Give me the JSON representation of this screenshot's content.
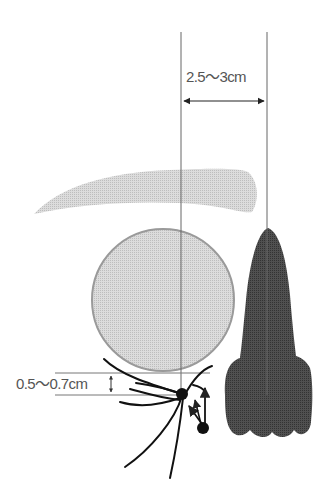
{
  "diagram": {
    "labels": {
      "width_measure": "2.5〜3cm",
      "height_measure": "0.5〜0.7cm"
    },
    "parts": [
      "eyebrow",
      "eye",
      "nose",
      "eyelashes",
      "measurement-lines"
    ],
    "colors": {
      "eyebrow": "#c9c9c9",
      "eye_fill": "#d6d6d6",
      "eye_stroke": "#9a9a9a",
      "nose": "#4a4a4a",
      "lines": "#666666",
      "lashes": "#111111",
      "text": "#555555"
    }
  }
}
